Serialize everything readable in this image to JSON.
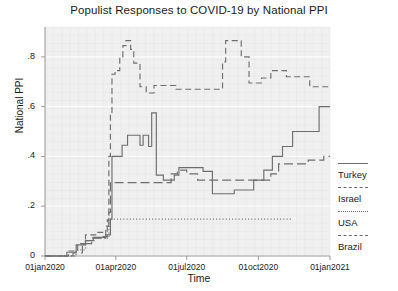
{
  "chart_data": {
    "type": "line",
    "title": "Populist Responses to COVID-19 by National PPI",
    "xlabel": "Time",
    "ylabel": "National PPI",
    "grid": true,
    "legend_position": "right",
    "xlim": [
      0,
      366
    ],
    "ylim": [
      0,
      0.92
    ],
    "yticks": [
      "0",
      ".2",
      ".4",
      ".6",
      ".8"
    ],
    "ytick_values": [
      0,
      0.2,
      0.4,
      0.6,
      0.8
    ],
    "xticks": [
      "01jan2020",
      "01apr2020",
      "01jul2020",
      "01oct2020",
      "01jan2021"
    ],
    "xtick_values": [
      0,
      91,
      182,
      274,
      366
    ],
    "series": [
      {
        "name": "Turkey",
        "style": "solid",
        "color": "#6e6e6e",
        "points": [
          [
            0,
            0.0
          ],
          [
            28,
            0.0
          ],
          [
            28,
            0.015
          ],
          [
            40,
            0.015
          ],
          [
            40,
            0.045
          ],
          [
            52,
            0.045
          ],
          [
            52,
            0.062
          ],
          [
            62,
            0.062
          ],
          [
            62,
            0.075
          ],
          [
            78,
            0.075
          ],
          [
            78,
            0.085
          ],
          [
            84,
            0.085
          ],
          [
            84,
            0.148
          ],
          [
            86,
            0.148
          ],
          [
            86,
            0.4
          ],
          [
            99,
            0.4
          ],
          [
            99,
            0.445
          ],
          [
            106,
            0.445
          ],
          [
            106,
            0.485
          ],
          [
            122,
            0.485
          ],
          [
            122,
            0.445
          ],
          [
            126,
            0.445
          ],
          [
            126,
            0.485
          ],
          [
            133,
            0.485
          ],
          [
            133,
            0.44
          ],
          [
            137,
            0.44
          ],
          [
            137,
            0.575
          ],
          [
            143,
            0.575
          ],
          [
            143,
            0.325
          ],
          [
            152,
            0.325
          ],
          [
            152,
            0.305
          ],
          [
            166,
            0.305
          ],
          [
            166,
            0.325
          ],
          [
            172,
            0.325
          ],
          [
            172,
            0.355
          ],
          [
            203,
            0.355
          ],
          [
            203,
            0.34
          ],
          [
            215,
            0.34
          ],
          [
            215,
            0.25
          ],
          [
            243,
            0.25
          ],
          [
            243,
            0.265
          ],
          [
            268,
            0.265
          ],
          [
            268,
            0.305
          ],
          [
            281,
            0.305
          ],
          [
            281,
            0.345
          ],
          [
            292,
            0.345
          ],
          [
            292,
            0.4
          ],
          [
            305,
            0.4
          ],
          [
            305,
            0.44
          ],
          [
            318,
            0.44
          ],
          [
            318,
            0.5
          ],
          [
            352,
            0.5
          ],
          [
            352,
            0.6
          ],
          [
            366,
            0.6
          ]
        ]
      },
      {
        "name": "Israel",
        "style": "dashed",
        "color": "#6e6e6e",
        "points": [
          [
            0,
            0.0
          ],
          [
            30,
            0.0
          ],
          [
            30,
            0.02
          ],
          [
            42,
            0.02
          ],
          [
            42,
            0.05
          ],
          [
            52,
            0.05
          ],
          [
            52,
            0.085
          ],
          [
            66,
            0.085
          ],
          [
            66,
            0.095
          ],
          [
            74,
            0.095
          ],
          [
            74,
            0.078
          ],
          [
            80,
            0.078
          ],
          [
            80,
            0.145
          ],
          [
            82,
            0.145
          ],
          [
            82,
            0.4
          ],
          [
            84,
            0.4
          ],
          [
            84,
            0.57
          ],
          [
            86,
            0.57
          ],
          [
            86,
            0.73
          ],
          [
            90,
            0.73
          ],
          [
            90,
            0.745
          ],
          [
            96,
            0.745
          ],
          [
            96,
            0.8
          ],
          [
            100,
            0.8
          ],
          [
            100,
            0.845
          ],
          [
            104,
            0.845
          ],
          [
            104,
            0.865
          ],
          [
            110,
            0.865
          ],
          [
            110,
            0.83
          ],
          [
            114,
            0.83
          ],
          [
            114,
            0.775
          ],
          [
            122,
            0.775
          ],
          [
            122,
            0.68
          ],
          [
            130,
            0.68
          ],
          [
            130,
            0.655
          ],
          [
            140,
            0.655
          ],
          [
            140,
            0.685
          ],
          [
            168,
            0.685
          ],
          [
            168,
            0.67
          ],
          [
            228,
            0.67
          ],
          [
            228,
            0.78
          ],
          [
            232,
            0.78
          ],
          [
            232,
            0.865
          ],
          [
            252,
            0.865
          ],
          [
            252,
            0.8
          ],
          [
            262,
            0.8
          ],
          [
            262,
            0.695
          ],
          [
            278,
            0.695
          ],
          [
            278,
            0.715
          ],
          [
            290,
            0.715
          ],
          [
            290,
            0.745
          ],
          [
            310,
            0.745
          ],
          [
            310,
            0.72
          ],
          [
            340,
            0.72
          ],
          [
            340,
            0.68
          ],
          [
            366,
            0.68
          ]
        ]
      },
      {
        "name": "USA",
        "style": "dotted",
        "color": "#6e6e6e",
        "points": [
          [
            0,
            0.0
          ],
          [
            40,
            0.0
          ],
          [
            40,
            0.025
          ],
          [
            52,
            0.025
          ],
          [
            52,
            0.062
          ],
          [
            64,
            0.062
          ],
          [
            64,
            0.072
          ],
          [
            82,
            0.072
          ],
          [
            82,
            0.148
          ],
          [
            316,
            0.148
          ]
        ]
      },
      {
        "name": "Brazil",
        "style": "dashdot",
        "color": "#6e6e6e",
        "points": [
          [
            0,
            0.0
          ],
          [
            36,
            0.0
          ],
          [
            36,
            0.012
          ],
          [
            48,
            0.012
          ],
          [
            48,
            0.05
          ],
          [
            60,
            0.05
          ],
          [
            60,
            0.072
          ],
          [
            78,
            0.072
          ],
          [
            78,
            0.12
          ],
          [
            82,
            0.12
          ],
          [
            82,
            0.175
          ],
          [
            84,
            0.175
          ],
          [
            84,
            0.295
          ],
          [
            162,
            0.295
          ],
          [
            162,
            0.33
          ],
          [
            170,
            0.33
          ],
          [
            170,
            0.345
          ],
          [
            182,
            0.345
          ],
          [
            182,
            0.33
          ],
          [
            196,
            0.33
          ],
          [
            196,
            0.305
          ],
          [
            290,
            0.305
          ],
          [
            290,
            0.33
          ],
          [
            300,
            0.33
          ],
          [
            300,
            0.37
          ],
          [
            338,
            0.37
          ],
          [
            338,
            0.385
          ],
          [
            358,
            0.385
          ],
          [
            358,
            0.4
          ],
          [
            366,
            0.4
          ]
        ]
      }
    ]
  },
  "legend": {
    "items": [
      {
        "label": "Turkey",
        "key": "line-solid"
      },
      {
        "label": "Israel",
        "key": "line-dashed"
      },
      {
        "label": "USA",
        "key": "line-dotted"
      },
      {
        "label": "Brazil",
        "key": "line-dashdot"
      }
    ]
  },
  "colors": {
    "line": "#6e6e6e",
    "plot_background": "#f0f0f0",
    "grid": "#e4e4e4",
    "axis": "#9a9a9a",
    "text": "#1a1a1a"
  }
}
